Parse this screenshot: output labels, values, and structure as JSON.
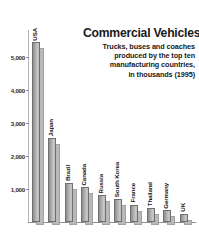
{
  "top_caption": "Index of which are commercial vehicles",
  "title": {
    "main": "Commercial Vehicles",
    "line1": "Trucks, buses and coaches",
    "line2": "produced by the top ten",
    "line3": "manufacturing countries,",
    "line4": "in thousands (1995)"
  },
  "chart_data": {
    "type": "bar",
    "title": "Commercial Vehicles",
    "subtitle": "Trucks, buses and coaches produced by the top ten manufacturing countries, in thousands (1995)",
    "xlabel": "",
    "ylabel": "",
    "ylim": [
      0,
      5600
    ],
    "grid": false,
    "legend": "none",
    "unit": "thousands",
    "year": 1995,
    "tick_labels": [
      "1,000",
      "2,000",
      "3,000",
      "4,000",
      "5,000"
    ],
    "tick_values": [
      1000,
      2000,
      3000,
      4000,
      5000
    ],
    "categories": [
      "USA",
      "Japan",
      "Brazil",
      "Canada",
      "Russia",
      "South Korea",
      "France",
      "Thailand",
      "Germany",
      "UK"
    ],
    "values": [
      5450,
      2550,
      1170,
      1050,
      820,
      700,
      520,
      420,
      350,
      250
    ]
  },
  "colors": {
    "bar_face": "#a8a8a8",
    "bar_shadow": "#b9b9b9",
    "bar_outline": "#6f6f6f",
    "axis": "#8f8f8f",
    "text": "#141414"
  }
}
